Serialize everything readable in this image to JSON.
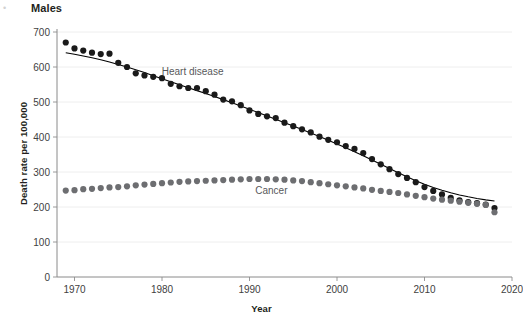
{
  "panel": {
    "title": "Males",
    "corner_mark": "•"
  },
  "chart_data": {
    "type": "scatter",
    "title": "Males",
    "xlabel": "Year",
    "ylabel": "Death rate per 100,000",
    "xlim": [
      1968,
      2020
    ],
    "ylim": [
      0,
      700
    ],
    "xticks": [
      1970,
      1980,
      1990,
      2000,
      2010,
      2020
    ],
    "xtick_labels": [
      "1970",
      "1980",
      "1990",
      "2000",
      "2010",
      "2020"
    ],
    "yticks": [
      0,
      100,
      200,
      300,
      400,
      500,
      600,
      700
    ],
    "ytick_labels": [
      "0",
      "100",
      "200",
      "300",
      "400",
      "500",
      "600",
      "700"
    ],
    "grid": "horizontal",
    "legend": "inline-annotations",
    "series": [
      {
        "name": "Heart disease",
        "color": "#1a1a1a",
        "marker": "circle",
        "trendline": true,
        "annotation": "Heart disease",
        "annotation_x": 1983.5,
        "annotation_y": 578,
        "x": [
          1969,
          1970,
          1971,
          1972,
          1973,
          1974,
          1975,
          1976,
          1977,
          1978,
          1979,
          1980,
          1981,
          1982,
          1983,
          1984,
          1985,
          1986,
          1987,
          1988,
          1989,
          1990,
          1991,
          1992,
          1993,
          1994,
          1995,
          1996,
          1997,
          1998,
          1999,
          2000,
          2001,
          2002,
          2003,
          2004,
          2005,
          2006,
          2007,
          2008,
          2009,
          2010,
          2011,
          2012,
          2013,
          2014,
          2015,
          2016,
          2017,
          2018
        ],
        "y": [
          670,
          653,
          647,
          641,
          637,
          638,
          612,
          600,
          582,
          576,
          572,
          568,
          552,
          545,
          540,
          540,
          531,
          521,
          507,
          502,
          491,
          476,
          466,
          459,
          454,
          441,
          431,
          422,
          413,
          401,
          392,
          385,
          374,
          366,
          354,
          337,
          322,
          308,
          294,
          283,
          271,
          257,
          246,
          236,
          226,
          219,
          214,
          211,
          207,
          197
        ]
      },
      {
        "name": "Cancer",
        "color": "#6d6e71",
        "marker": "circle",
        "trendline": false,
        "annotation": "Cancer",
        "annotation_x": 1992.5,
        "annotation_y": 236,
        "x": [
          1969,
          1970,
          1971,
          1972,
          1973,
          1974,
          1975,
          1976,
          1977,
          1978,
          1979,
          1980,
          1981,
          1982,
          1983,
          1984,
          1985,
          1986,
          1987,
          1988,
          1989,
          1990,
          1991,
          1992,
          1993,
          1994,
          1995,
          1996,
          1997,
          1998,
          1999,
          2000,
          2001,
          2002,
          2003,
          2004,
          2005,
          2006,
          2007,
          2008,
          2009,
          2010,
          2011,
          2012,
          2013,
          2014,
          2015,
          2016,
          2017,
          2018
        ],
        "y": [
          247,
          248,
          251,
          252,
          254,
          256,
          257,
          259,
          262,
          264,
          266,
          268,
          270,
          272,
          273,
          274,
          275,
          276,
          277,
          278,
          279,
          280,
          280,
          280,
          279,
          278,
          276,
          274,
          271,
          268,
          265,
          262,
          259,
          256,
          253,
          249,
          246,
          243,
          240,
          236,
          232,
          228,
          224,
          221,
          218,
          215,
          212,
          209,
          206,
          185
        ]
      }
    ]
  },
  "axis": {
    "x_axis_line": "x-axis",
    "y_axis_line": "y-axis"
  }
}
